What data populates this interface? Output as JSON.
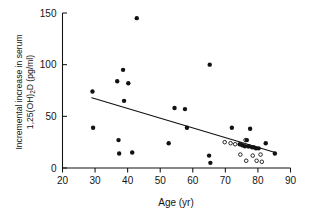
{
  "figure": {
    "caption_visible": false,
    "background": "#ffffff",
    "ink": "#121212"
  },
  "chart_data": {
    "type": "scatter",
    "title": "",
    "xlabel": "Age (yr)",
    "ylabel": "Incremental increase in serum 1,25(OH)₂D (pg/ml)",
    "ylabel_line1": "Incremental increase in serum",
    "ylabel_line2_prefix": "1,25(OH)",
    "ylabel_line2_sub": "2",
    "ylabel_line2_suffix": "D (pg/ml)",
    "xlim": [
      20,
      90
    ],
    "ylim": [
      0,
      150
    ],
    "xticks": [
      20,
      30,
      40,
      50,
      60,
      70,
      80,
      90
    ],
    "yticks": [
      0,
      50,
      100,
      150
    ],
    "xticklabels": [
      "20",
      "30",
      "40",
      "50",
      "60",
      "70",
      "80",
      "90"
    ],
    "yticklabels": [
      "0",
      "50",
      "100",
      "150"
    ],
    "grid": false,
    "legend": false,
    "legend_position": "none",
    "series": [
      {
        "name": "filled",
        "marker": "filled-circle",
        "marker_color": "#121212",
        "marker_size": 4.2,
        "points": [
          [
            29.2,
            74
          ],
          [
            29.4,
            39
          ],
          [
            36.8,
            84
          ],
          [
            37.2,
            27
          ],
          [
            37.4,
            14
          ],
          [
            38.6,
            95
          ],
          [
            38.9,
            65
          ],
          [
            40.2,
            82
          ],
          [
            41.4,
            15
          ],
          [
            42.8,
            145
          ],
          [
            52.6,
            24
          ],
          [
            54.4,
            58
          ],
          [
            57.6,
            57
          ],
          [
            58.2,
            39
          ],
          [
            65.2,
            100
          ],
          [
            65.0,
            12
          ],
          [
            65.4,
            5
          ],
          [
            72.0,
            39
          ],
          [
            74.4,
            23
          ],
          [
            75.2,
            22
          ],
          [
            76.0,
            21
          ],
          [
            76.6,
            27
          ],
          [
            77.2,
            21
          ],
          [
            77.6,
            38
          ],
          [
            78.2,
            20
          ],
          [
            78.8,
            20
          ],
          [
            79.4,
            19
          ],
          [
            80.2,
            19
          ],
          [
            82.4,
            24
          ],
          [
            85.2,
            14
          ]
        ]
      },
      {
        "name": "open",
        "marker": "open-circle",
        "marker_color": "#ffffff",
        "marker_edge": "#121212",
        "marker_size": 3.4,
        "points": [
          [
            69.8,
            25
          ],
          [
            71.6,
            24
          ],
          [
            73.0,
            23
          ],
          [
            74.6,
            13
          ],
          [
            76.2,
            27
          ],
          [
            76.4,
            7
          ],
          [
            77.0,
            21
          ],
          [
            78.4,
            12
          ],
          [
            79.6,
            7
          ],
          [
            80.8,
            13
          ],
          [
            81.2,
            6
          ]
        ]
      }
    ],
    "fit_line": {
      "name": "regression-line",
      "x_start": 29.0,
      "y_start": 68,
      "x_end": 85.3,
      "y_end": 15,
      "color": "#121212"
    }
  }
}
